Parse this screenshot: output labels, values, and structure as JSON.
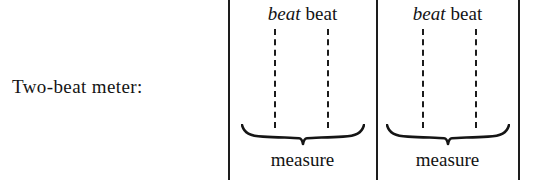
{
  "figure": {
    "caption": "Two-beat meter:",
    "background_color": "#ffffff",
    "ink_color": "#131313"
  },
  "measures": [
    {
      "beats": [
        {
          "label": "beat",
          "style": "italic"
        },
        {
          "label": "beat",
          "style": "roman"
        }
      ],
      "brace_label": "measure"
    },
    {
      "beats": [
        {
          "label": "beat",
          "style": "italic"
        },
        {
          "label": "beat",
          "style": "roman"
        }
      ],
      "brace_label": "measure"
    }
  ],
  "barlines": [
    {
      "name": "left"
    },
    {
      "name": "middle"
    },
    {
      "name": "right"
    }
  ]
}
